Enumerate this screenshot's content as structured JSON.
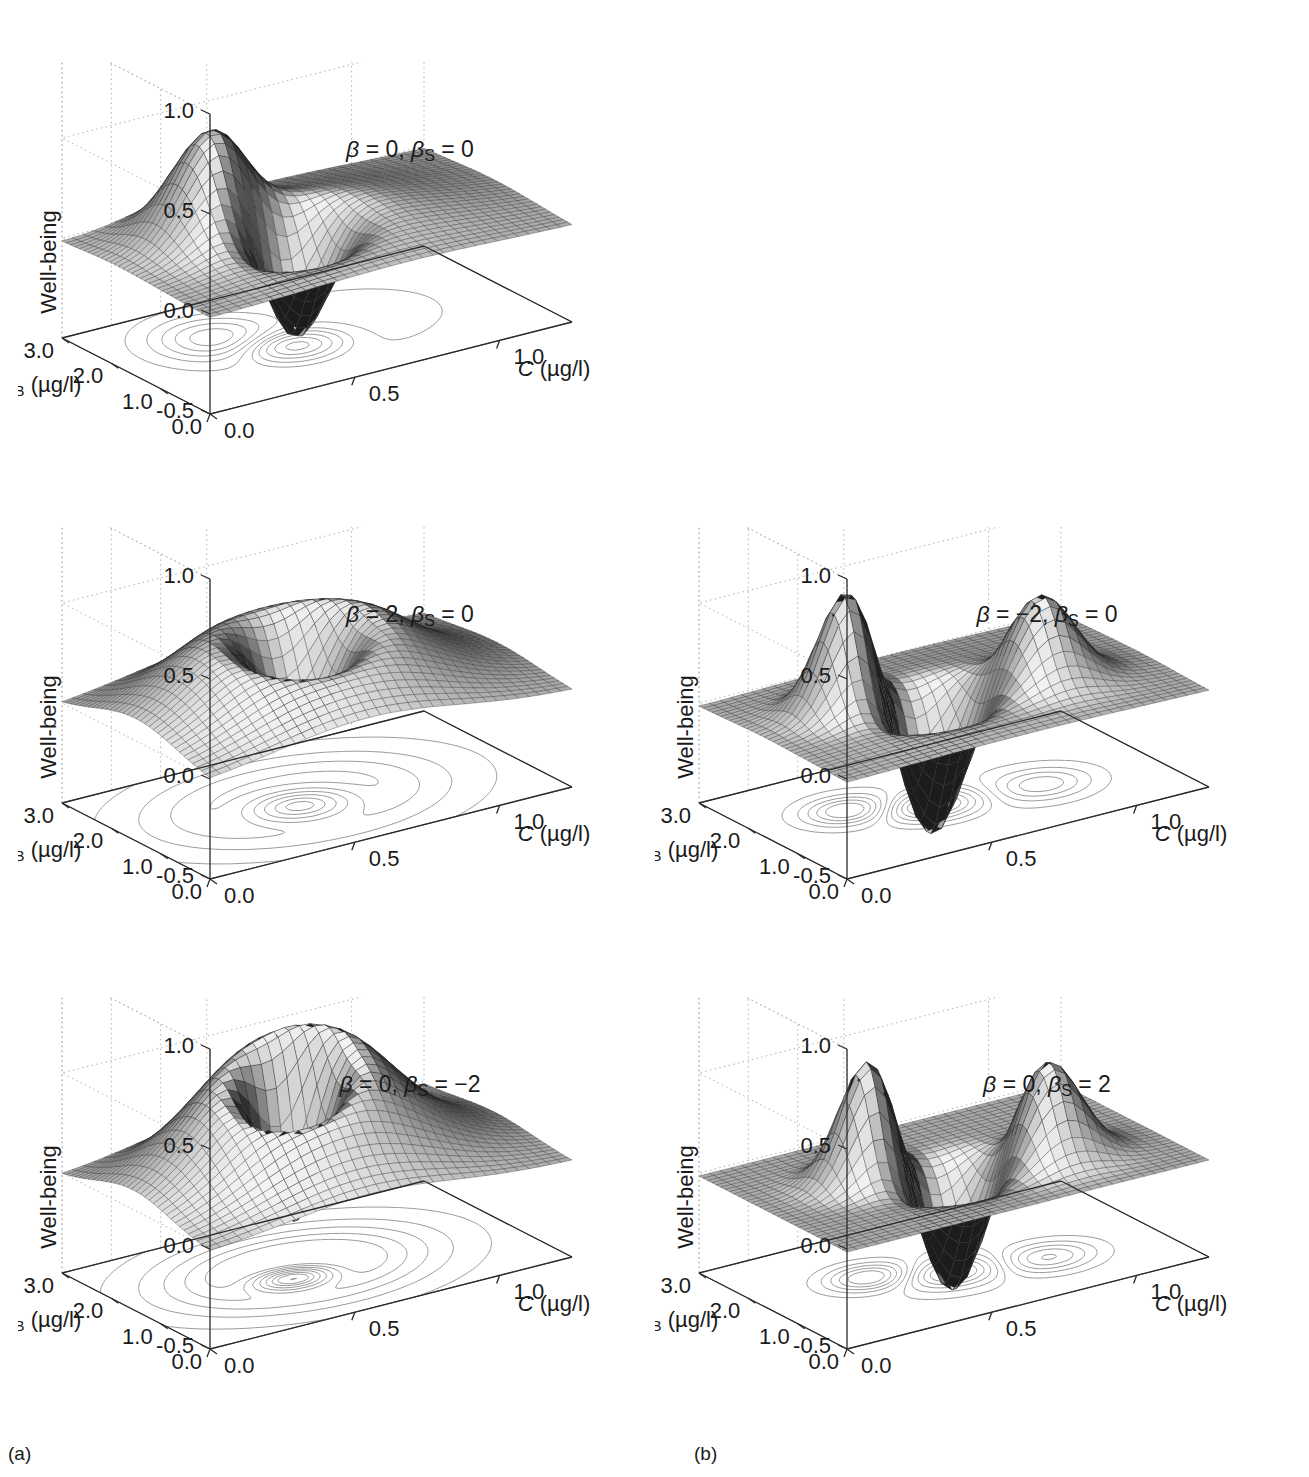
{
  "figure": {
    "panel_label_a": "(a)",
    "panel_label_b": "(b)",
    "zlabel": "Well-being",
    "xlabel_italic": "C",
    "xlabel_units": " (µg/l)",
    "ylabel_italic": "C",
    "ylabel_sub": "B",
    "ylabel_units": " (µg/l)"
  },
  "chart_data": [
    {
      "id": "p1",
      "type": "surface",
      "title": "β = 0, βS = 0",
      "annotation": "β = 0, βₛ = 0",
      "beta": 0,
      "beta_s": 0,
      "column": "a",
      "row": 1,
      "zlabel": "Well-being",
      "xlabel": "C (µg/l)",
      "ylabel": "CB (µg/l)",
      "zticks": [
        "1.0",
        "0.5",
        "0.0",
        "-0.5"
      ],
      "zvalues": [
        1.0,
        0.5,
        0.0,
        -0.5
      ],
      "zlim": [
        -0.5,
        1.0
      ],
      "xticks": [
        "0.0",
        "0.5",
        "1.0"
      ],
      "xvalues": [
        0.0,
        0.5,
        1.0
      ],
      "xlim": [
        0.0,
        1.25
      ],
      "yticks": [
        "0.0",
        "1.0",
        "2.0",
        "3.0"
      ],
      "yvalues": [
        0.0,
        1.0,
        2.0,
        3.0
      ],
      "ylim": [
        0.0,
        3.0
      ],
      "grid": true,
      "contour_projection": true,
      "surface_features": "flat plateau near 0 with a single deep central trough reaching about -0.5 and a low broad ridge rising to about +0.45 on the far left edge",
      "peak_z": 0.45,
      "trough_z": -0.5
    },
    {
      "id": "p2",
      "type": "surface",
      "title": "β = 2, βS = 0",
      "annotation": "β = 2, βₛ = 0",
      "beta": 2,
      "beta_s": 0,
      "column": "a",
      "row": 2,
      "zlabel": "Well-being",
      "xlabel": "C (µg/l)",
      "ylabel": "CB (µg/l)",
      "zticks": [
        "1.0",
        "0.5",
        "0.0",
        "-0.5"
      ],
      "zvalues": [
        1.0,
        0.5,
        0.0,
        -0.5
      ],
      "zlim": [
        -0.5,
        1.0
      ],
      "xticks": [
        "0.0",
        "0.5",
        "1.0"
      ],
      "xvalues": [
        0.0,
        0.5,
        1.0
      ],
      "xlim": [
        0.0,
        1.25
      ],
      "yticks": [
        "0.0",
        "1.0",
        "2.0",
        "3.0"
      ],
      "yvalues": [
        0.0,
        1.0,
        2.0,
        3.0
      ],
      "ylim": [
        0.0,
        3.0
      ],
      "grid": true,
      "contour_projection": true,
      "surface_features": "broad raised plateau reaching about +0.5 surrounding a deep central trough that falls to about -0.5",
      "peak_z": 0.5,
      "trough_z": -0.5
    },
    {
      "id": "p3",
      "type": "surface",
      "title": "β = -2, βS = 0",
      "annotation": "β = −2, βₛ = 0",
      "beta": -2,
      "beta_s": 0,
      "column": "b",
      "row": 2,
      "zlabel": "Well-being",
      "xlabel": "C (µg/l)",
      "ylabel": "CB (µg/l)",
      "zticks": [
        "1.0",
        "0.5",
        "0.0",
        "-0.5"
      ],
      "zvalues": [
        1.0,
        0.5,
        0.0,
        -0.5
      ],
      "zlim": [
        -0.5,
        1.0
      ],
      "xticks": [
        "0.0",
        "0.5",
        "1.0"
      ],
      "xvalues": [
        0.0,
        0.5,
        1.0
      ],
      "xlim": [
        0.0,
        1.25
      ],
      "yticks": [
        "0.0",
        "1.0",
        "2.0",
        "3.0"
      ],
      "yvalues": [
        0.0,
        1.0,
        2.0,
        3.0
      ],
      "ylim": [
        0.0,
        3.0
      ],
      "grid": true,
      "contour_projection": true,
      "surface_features": "a sharp peak of about +0.45 on the left, a second smaller peak on the right, and a deep central trough descending to about -0.5 between them",
      "peak_z": 0.45,
      "trough_z": -0.5
    },
    {
      "id": "p4",
      "type": "surface",
      "title": "β = 0, βS = -2",
      "annotation": "β = 0, βₛ = −2",
      "beta": 0,
      "beta_s": -2,
      "column": "a",
      "row": 3,
      "zlabel": "Well-being",
      "xlabel": "C (µg/l)",
      "ylabel": "CB (µg/l)",
      "zticks": [
        "1.0",
        "0.5",
        "0.0",
        "-0.5"
      ],
      "zvalues": [
        1.0,
        0.5,
        0.0,
        -0.5
      ],
      "zlim": [
        -0.5,
        1.0
      ],
      "xticks": [
        "0.0",
        "0.5",
        "1.0"
      ],
      "xvalues": [
        0.0,
        0.5,
        1.0
      ],
      "xlim": [
        0.0,
        1.25
      ],
      "yticks": [
        "0.0",
        "1.0",
        "2.0",
        "3.0"
      ],
      "yvalues": [
        0.0,
        1.0,
        2.0,
        3.0
      ],
      "ylim": [
        0.0,
        3.0
      ],
      "grid": true,
      "contour_projection": true,
      "surface_features": "a large smooth dome rising to about +0.55 with a single narrow trough cut through its near side down to about -0.5; concentric elliptical contours on the base",
      "peak_z": 0.55,
      "trough_z": -0.5
    },
    {
      "id": "p5",
      "type": "surface",
      "title": "β = 0, βS = 2",
      "annotation": "β = 0, βₛ = 2",
      "beta": 0,
      "beta_s": 2,
      "column": "b",
      "row": 3,
      "zlabel": "Well-being",
      "xlabel": "C (µg/l)",
      "ylabel": "CB (µg/l)",
      "zticks": [
        "1.0",
        "0.5",
        "0.0",
        "-0.5"
      ],
      "zvalues": [
        1.0,
        0.5,
        0.0,
        -0.5
      ],
      "zlim": [
        -0.5,
        1.0
      ],
      "xticks": [
        "0.0",
        "0.5",
        "1.0"
      ],
      "xvalues": [
        0.0,
        0.5,
        1.0
      ],
      "xlim": [
        0.0,
        3.0
      ],
      "yticks": [
        "0.0",
        "1.0",
        "2.0",
        "3.0"
      ],
      "yvalues": [
        0.0,
        1.0,
        2.0,
        3.0
      ],
      "ylim": [
        0.0,
        3.0
      ],
      "grid": true,
      "contour_projection": true,
      "surface_features": "flat plane near 0 with two tall separate peaks reaching about +0.45, one at left and one at right, and a deep narrow valley between them down to about -0.5",
      "peak_z": 0.45,
      "trough_z": -0.5
    }
  ]
}
